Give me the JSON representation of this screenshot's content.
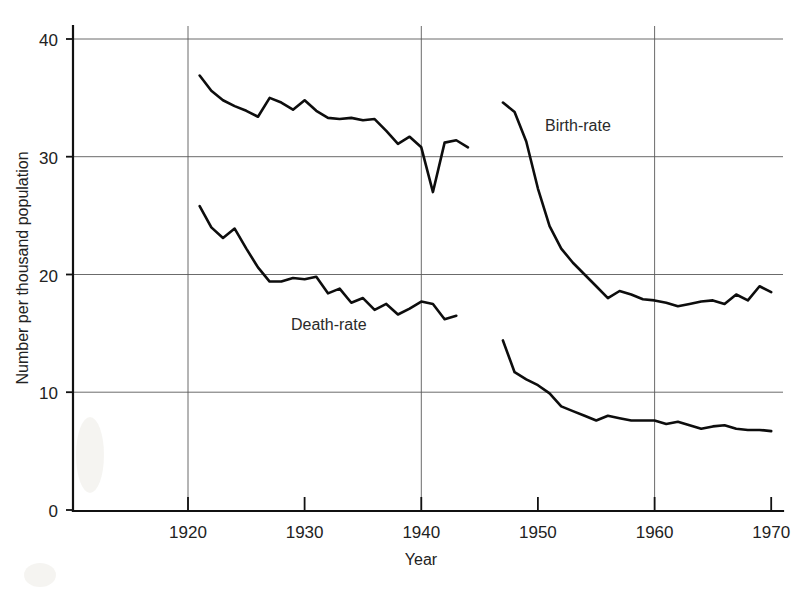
{
  "chart_data": {
    "type": "line",
    "title": "",
    "xlabel": "Year",
    "ylabel": "Number per thousand population",
    "xlim": [
      1913,
      1971
    ],
    "ylim": [
      0,
      42
    ],
    "xticks": [
      1920,
      1930,
      1940,
      1950,
      1960,
      1970
    ],
    "xtick_labels": [
      "1920",
      "1930",
      "1940",
      "1950",
      "1960",
      "1970"
    ],
    "yticks": [
      0,
      10,
      20,
      30,
      40
    ],
    "ytick_labels": [
      "0",
      "10",
      "20",
      "30",
      "40"
    ],
    "grid": "horizontal gridlines at 10,20,30,40; vertical gridlines at 1920,1940,1960",
    "legend": "inline annotations beside curves",
    "line_color": "#0d0d0d",
    "series": [
      {
        "name": "Birth-rate",
        "label_text": "Birth-rate",
        "segments": [
          {
            "x": [
              1921,
              1922,
              1923,
              1924,
              1925,
              1926,
              1927,
              1928,
              1929,
              1930,
              1931,
              1932,
              1933,
              1934,
              1935,
              1936,
              1937,
              1938,
              1939,
              1940,
              1941,
              1942,
              1943,
              1944
            ],
            "y": [
              36.9,
              35.6,
              34.8,
              34.3,
              33.9,
              33.4,
              35.0,
              34.6,
              34.0,
              34.8,
              33.9,
              33.3,
              33.2,
              33.3,
              33.1,
              33.2,
              32.2,
              31.1,
              31.7,
              30.8,
              27.0,
              31.2,
              31.4,
              30.8
            ]
          },
          {
            "x": [
              1947,
              1948,
              1949,
              1950,
              1951,
              1952,
              1953,
              1954,
              1955,
              1956,
              1957,
              1958,
              1959,
              1960,
              1961,
              1962,
              1963,
              1964,
              1965,
              1966,
              1967,
              1968,
              1969,
              1970
            ],
            "y": [
              34.6,
              33.8,
              31.3,
              27.3,
              24.1,
              22.2,
              21.0,
              20.0,
              19.0,
              18.0,
              18.6,
              18.3,
              17.9,
              17.8,
              17.6,
              17.3,
              17.5,
              17.7,
              17.8,
              17.5,
              18.3,
              17.8,
              19.0,
              18.5
            ]
          }
        ]
      },
      {
        "name": "Death-rate",
        "label_text": "Death-rate",
        "segments": [
          {
            "x": [
              1921,
              1922,
              1923,
              1924,
              1925,
              1926,
              1927,
              1928,
              1929,
              1930,
              1931,
              1932,
              1933,
              1934,
              1935,
              1936,
              1937,
              1938,
              1939,
              1940,
              1941,
              1942,
              1943
            ],
            "y": [
              25.8,
              24.0,
              23.1,
              23.9,
              22.2,
              20.6,
              19.4,
              19.4,
              19.7,
              19.6,
              19.8,
              18.4,
              18.8,
              17.6,
              18.0,
              17.0,
              17.5,
              16.6,
              17.1,
              17.7,
              17.5,
              16.2,
              16.5
            ]
          },
          {
            "x": [
              1947,
              1948,
              1949,
              1950,
              1951,
              1952,
              1953,
              1954,
              1955,
              1956,
              1957,
              1958,
              1959,
              1960,
              1961,
              1962,
              1963,
              1964,
              1965,
              1966,
              1967,
              1968,
              1969,
              1970
            ],
            "y": [
              14.4,
              11.7,
              11.1,
              10.6,
              9.9,
              8.8,
              8.4,
              8.0,
              7.6,
              8.0,
              7.8,
              7.6,
              7.6,
              7.6,
              7.3,
              7.5,
              7.2,
              6.9,
              7.1,
              7.2,
              6.9,
              6.8,
              6.8,
              6.7
            ]
          }
        ]
      }
    ]
  },
  "axes": {
    "y_axis_title": "Number per thousand population",
    "x_axis_title": "Year",
    "y_tick_labels": [
      "40",
      "30",
      "20",
      "10",
      "0"
    ],
    "x_tick_labels": [
      "1920",
      "1930",
      "1940",
      "1950",
      "1960",
      "1970"
    ]
  },
  "annotations": {
    "birth_rate": "Birth-rate",
    "death_rate": "Death-rate"
  }
}
